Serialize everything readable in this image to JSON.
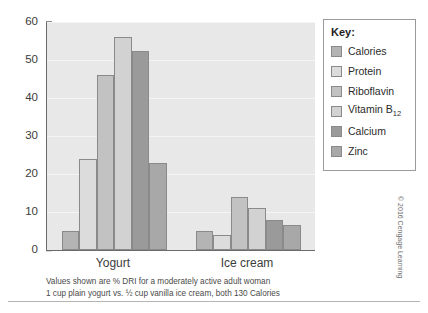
{
  "chart_data": {
    "type": "bar",
    "title": "",
    "xlabel": "",
    "ylabel": "",
    "categories": [
      "Yogurt",
      "Ice cream"
    ],
    "series": [
      {
        "name": "Calories",
        "values": [
          5,
          5
        ],
        "color": "#b4b4b4"
      },
      {
        "name": "Protein",
        "values": [
          24,
          4
        ],
        "color": "#dcdcdc"
      },
      {
        "name": "Riboflavin",
        "values": [
          46,
          14
        ],
        "color": "#c2c2c2"
      },
      {
        "name": "Vitamin B12",
        "values": [
          56,
          11
        ],
        "color": "#d2d2d2"
      },
      {
        "name": "Calcium",
        "values": [
          52.5,
          8
        ],
        "color": "#9a9a9a"
      },
      {
        "name": "Zinc",
        "values": [
          23,
          6.5
        ],
        "color": "#a8a8a8"
      }
    ],
    "ylim": [
      0,
      60
    ],
    "yticks": [
      0,
      10,
      20,
      30,
      40,
      50,
      60
    ],
    "ytick_labels": [
      "0",
      "10",
      "20",
      "30",
      "40",
      "50",
      "60"
    ],
    "grid": true,
    "legend_position": "right",
    "plot_background": "#e8e8e8"
  },
  "legend": {
    "title": "Key:",
    "entries": [
      {
        "label": "Calories"
      },
      {
        "label": "Protein"
      },
      {
        "label": "Riboflavin"
      },
      {
        "label": "Vitamin B",
        "subscript": "12"
      },
      {
        "label": "Calcium"
      },
      {
        "label": "Zinc"
      }
    ]
  },
  "caption": {
    "line1": "Values shown are % DRI for a moderately active adult woman",
    "line2": "1 cup plain yogurt vs. ½ cup vanilla ice cream, both 130 Calories"
  },
  "credit": {
    "text": "© 2016 Cengage Learning"
  }
}
